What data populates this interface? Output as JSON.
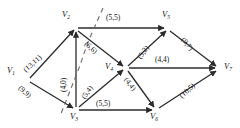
{
  "diagram": {
    "type": "directed-graph",
    "edge_label_format": "(capacity,flow)",
    "nodes": [
      {
        "id": "V1",
        "label": "V",
        "sub": "1",
        "x": 28,
        "y": 80,
        "label_x": 7,
        "label_y": 66
      },
      {
        "id": "V2",
        "label": "V",
        "sub": "2",
        "x": 76,
        "y": 28,
        "label_x": 62,
        "label_y": 10
      },
      {
        "id": "V3",
        "label": "V",
        "sub": "3",
        "x": 76,
        "y": 110,
        "label_x": 70,
        "label_y": 112
      },
      {
        "id": "V4",
        "label": "V",
        "sub": "4",
        "x": 126,
        "y": 68,
        "label_x": 105,
        "label_y": 62
      },
      {
        "id": "V5",
        "label": "V",
        "sub": "5",
        "x": 168,
        "y": 28,
        "label_x": 162,
        "label_y": 10
      },
      {
        "id": "V6",
        "label": "V",
        "sub": "6",
        "x": 156,
        "y": 110,
        "label_x": 150,
        "label_y": 112
      },
      {
        "id": "V7",
        "label": "V",
        "sub": "7",
        "x": 219,
        "y": 68,
        "label_x": 224,
        "label_y": 62
      }
    ],
    "edges": [
      {
        "id": "e1",
        "from": "V1",
        "to": "V2",
        "label": "(13,11)",
        "label_x": 22,
        "label_y": 68,
        "rot": "rot-m45"
      },
      {
        "id": "e2",
        "from": "V1",
        "to": "V3",
        "label": "(9,9)",
        "label_x": 22,
        "label_y": 84,
        "rot": "rot-p45"
      },
      {
        "id": "e3",
        "from": "V3",
        "to": "V2",
        "label": "(4,0)",
        "label_x": 60,
        "label_y": 92,
        "rot": "rot-vert"
      },
      {
        "id": "e4",
        "from": "V2",
        "to": "V5",
        "label": "(5,5)",
        "label_x": 106,
        "label_y": 14,
        "rot": ""
      },
      {
        "id": "e5",
        "from": "V2",
        "to": "V4",
        "label": "(6,6)",
        "label_x": 88,
        "label_y": 40,
        "rot": "rot-p45"
      },
      {
        "id": "e6",
        "from": "V3",
        "to": "V4",
        "label": "(5,4)",
        "label_x": 80,
        "label_y": 94,
        "rot": "rot-m55"
      },
      {
        "id": "e7",
        "from": "V3",
        "to": "V6",
        "label": "(5,5)",
        "label_x": 96,
        "label_y": 100,
        "rot": ""
      },
      {
        "id": "e8",
        "from": "V4",
        "to": "V5",
        "label": "(5,2)",
        "label_x": 136,
        "label_y": 56,
        "rot": "rot-m55"
      },
      {
        "id": "e9",
        "from": "V4",
        "to": "V7",
        "label": "(4,4)",
        "label_x": 155,
        "label_y": 56,
        "rot": ""
      },
      {
        "id": "e10",
        "from": "V4",
        "to": "V6",
        "label": "(4,4)",
        "label_x": 129,
        "label_y": 76,
        "rot": "rot-p55"
      },
      {
        "id": "e11",
        "from": "V5",
        "to": "V7",
        "label": "(9,7)",
        "label_x": 186,
        "label_y": 36,
        "rot": "rot-p55"
      },
      {
        "id": "e12",
        "from": "V6",
        "to": "V7",
        "label": "(10,5)",
        "label_x": 178,
        "label_y": 92,
        "rot": "rot-m45"
      }
    ],
    "cut": {
      "id": "cut-line",
      "style": "dashed",
      "points": "103,8 88,42 79,68 68,96 60,116"
    }
  }
}
